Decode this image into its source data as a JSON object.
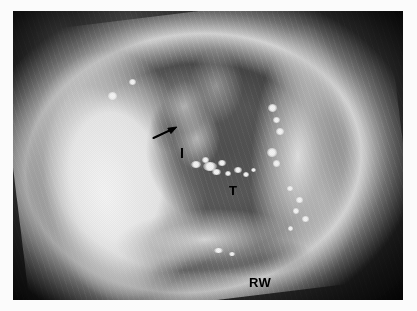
{
  "figure": {
    "kind": "intraoperative-photograph",
    "modality": "surgical-microscope",
    "color_mode": "grayscale",
    "alt": "Grayscale intraoperative otologic photograph of a middle ear cavity viewed through the external auditory canal, with anatomical structures labelled.",
    "frame": {
      "background_color": "#fbfbfb",
      "image_left": 13,
      "image_top": 11,
      "image_width": 390,
      "image_height": 289
    },
    "palette": {
      "page_background": "#fbfbfb",
      "photo_darkest": "#070707",
      "photo_midtone": "#6f6f6f",
      "photo_highlight": "#ffffff",
      "annotation_color": "#000000"
    }
  },
  "annotations": {
    "pointer": {
      "name": "arrow",
      "shape": "solid-arrow",
      "direction": "up-right",
      "tail_x": 150,
      "tail_y": 139,
      "tip_x": 180,
      "tip_y": 126
    },
    "labels": [
      {
        "id": "incus",
        "text": "I",
        "x": 180,
        "y": 146
      },
      {
        "id": "tympanic",
        "text": "T",
        "x": 229,
        "y": 184
      },
      {
        "id": "round-window",
        "text": "RW",
        "x": 249,
        "y": 276
      }
    ]
  },
  "specular_highlights": [
    {
      "x": 196,
      "y": 164,
      "w": 10,
      "h": 7
    },
    {
      "x": 205,
      "y": 160,
      "w": 7,
      "h": 6
    },
    {
      "x": 210,
      "y": 166,
      "w": 14,
      "h": 9
    },
    {
      "x": 222,
      "y": 163,
      "w": 8,
      "h": 6
    },
    {
      "x": 216,
      "y": 172,
      "w": 9,
      "h": 6
    },
    {
      "x": 228,
      "y": 173,
      "w": 6,
      "h": 5
    },
    {
      "x": 238,
      "y": 170,
      "w": 8,
      "h": 6
    },
    {
      "x": 246,
      "y": 174,
      "w": 6,
      "h": 5
    },
    {
      "x": 253,
      "y": 170,
      "w": 5,
      "h": 4
    },
    {
      "x": 272,
      "y": 108,
      "w": 9,
      "h": 8
    },
    {
      "x": 276,
      "y": 120,
      "w": 7,
      "h": 6
    },
    {
      "x": 280,
      "y": 131,
      "w": 8,
      "h": 7
    },
    {
      "x": 272,
      "y": 152,
      "w": 10,
      "h": 9
    },
    {
      "x": 276,
      "y": 163,
      "w": 7,
      "h": 7
    },
    {
      "x": 290,
      "y": 188,
      "w": 6,
      "h": 5
    },
    {
      "x": 299,
      "y": 200,
      "w": 7,
      "h": 6
    },
    {
      "x": 296,
      "y": 211,
      "w": 6,
      "h": 6
    },
    {
      "x": 305,
      "y": 219,
      "w": 7,
      "h": 6
    },
    {
      "x": 290,
      "y": 228,
      "w": 5,
      "h": 5
    },
    {
      "x": 218,
      "y": 250,
      "w": 9,
      "h": 5
    },
    {
      "x": 232,
      "y": 254,
      "w": 6,
      "h": 4
    },
    {
      "x": 112,
      "y": 96,
      "w": 9,
      "h": 8
    },
    {
      "x": 132,
      "y": 82,
      "w": 7,
      "h": 6
    }
  ]
}
